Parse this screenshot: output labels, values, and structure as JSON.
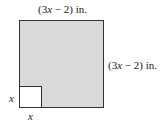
{
  "diagram": {
    "top_label": {
      "prefix": "(3",
      "var": "x",
      "suffix": " − 2) in."
    },
    "right_label": {
      "prefix": "(3",
      "var": "x",
      "suffix": " − 2) in."
    },
    "small_side_label": "x",
    "small_bottom_label": "x",
    "colors": {
      "fill": "#d9d9d9",
      "border": "#333333",
      "cutout": "#ffffff"
    }
  }
}
